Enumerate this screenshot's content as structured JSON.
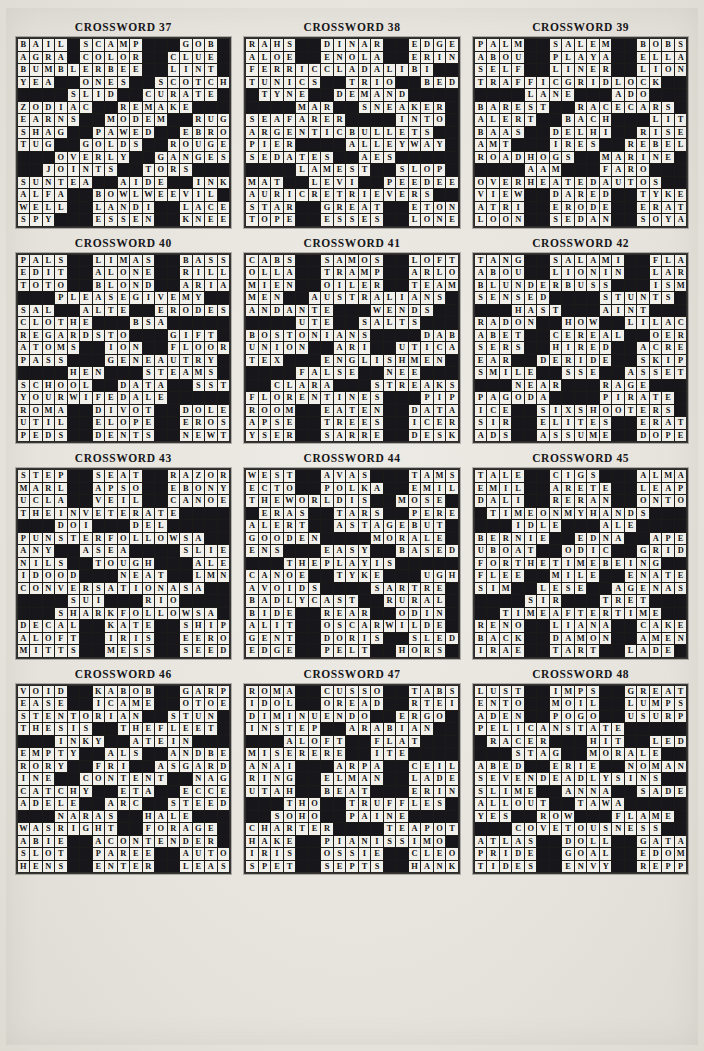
{
  "page": {
    "kind": "crossword-solutions-page",
    "grid_size": 17,
    "columns": 3,
    "rows": 4,
    "block_char": "#",
    "colors": {
      "paper": "#e8e6e0",
      "cell_fill": "#f2f0ea",
      "block_fill": "#17161a",
      "text": "#111014"
    }
  },
  "puzzles": [
    {
      "title": "CROSSWORD 37",
      "rows": [
        "BAIL#SCAMP###GOB#",
        "AGRA#COLOR##CLUE#",
        "BUMBLERBEE##LINT#",
        "YEA##ONES##SCOTCH",
        "####SLID##CURATE#",
        "ZODIAC##REMAKE###",
        "EARNS##MODEM##RUG",
        "SHAG##PAWED##EBRO",
        "TUG##GOLDS##ROUGE",
        "###OVERLY##GANGES",
        "##JOINTS##TORS###",
        "SUNTEA##AIDE##INK",
        "ALFA##BOWLWEEVIL#",
        "WELL##LANDI##LACE",
        "SPY###ESSEN##KNEE"
      ]
    },
    {
      "title": "CROSSWORD 38",
      "rows": [
        "RAHS##DINAR##EDGE#",
        "ALOE##ENOLA##ERIN#",
        "FERRICCLADALIBI##",
        "TUNICS##TRIO##BED#",
        "#TYNE##DEMAND####",
        "####MAR##SNEAKER#",
        "SEAFARER####INTO#",
        "ARGENTICBULLETS##",
        "PIER####ALLEYWAY#",
        "SEDATES##AES#####",
        "####LAMEST##SLOP#",
        "MAT##LEVI##PEEDEE",
        "AURICRETRIEVERS##",
        "STAR##GREAT##ETON",
        "TOPE##ESSES##LONE"
      ]
    },
    {
      "title": "CROSSWORD 39",
      "rows": [
        "PALM##SALEM##BOBS#",
        "ABOU##PLAYA##ELLA#",
        "SELF##LINER##LION#",
        "TRAFFICGRIDLOCK##",
        "####LANE###ADO###",
        "BAREST##RACECARS#",
        "ALERT##BACH###LIT",
        "BAAS##DELHI##RISE",
        "AMT###IRES##REBEL",
        "ROADHOGS##MARINE#",
        "####AAM###FARO###",
        "OVERHEATEDAUTOS##",
        "VIEW##DARED##TYKE",
        "ATRI##ERODE##ERAT",
        "LOON##SEDAN##SOYA"
      ]
    },
    {
      "title": "CROSSWORD 40",
      "rows": [
        "PALS##LIMAS##BASS#",
        "EDIT##ALONE##RILL#",
        "TOTO##BLOND##ARIA#",
        "###PLEASEGIVEMY##",
        "SAL##ALTE##ERODES",
        "CLOTHE###BSA#####",
        "REGARDSTO###GIFT#",
        "ATOMS##ION##FLOOR",
        "PASS###GENEAUTRY#",
        "####HEN###STEAMS#",
        "SCHOOL##DATA##SST",
        "YOURWIFEDALE#####",
        "ROMA##DIVOT##DOLE",
        "UTIL##ELOPE##EROS",
        "PEDS##DENTS##NEWT"
      ]
    },
    {
      "title": "CROSSWORD 41",
      "rows": [
        "CABS##SAMOS##LOFT#",
        "OLLA##TRAMP##ARLO#",
        "MIEN##OILER##TEAM#",
        "MEN##AUSTRALIANS#",
        "ANDANTE###WENDS##",
        "####UTE##SALTS###",
        "BOSTONIANS####DAB",
        "UNION##ARI##UTICA",
        "TEX###ENGLISHMEN#",
        "####FALSE##NEE###",
        "##CLARA###STREAKS",
        "FLORENTINES###PIP",
        "ROOM##EATEN##DATA",
        "APSE##TREES##ICER",
        "YSER##SARRE##DESK"
      ]
    },
    {
      "title": "CROSSWORD 42",
      "rows": [
        "TANG##SALAMI##FLA#",
        "ABOU##LIONIN##LAR#",
        "BLUNDERBUSS###ISM",
        "SENSED####STUNTS#",
        "###HAST###AINT###",
        "RADON##HOW##LILAC",
        "ABET##CEREAL##OER",
        "SERS##HIRED##ACRE",
        "EAR##DERIDE##SKIP",
        "SMILE##SSE##ASSET",
        "###NEAR###RAGE###",
        "PAGODA####PIRATE#",
        "ICE##SIXSHOOTERS#",
        "SIR##ELITES##ERAT",
        "ADS##ASSUME##DOPE"
      ]
    },
    {
      "title": "CROSSWORD 43",
      "rows": [
        "STEP##SEAT##RAZOR#",
        "MARL##APSO##EBONY#",
        "UCLA##VEIL##CANOE#",
        "THEINVETERATE####",
        "###DOI###DEL#####",
        "PUNSTERFOLLOWSA##",
        "ANY##ASEA####SLIER",
        "NILS##TOUGH###ALEE",
        "IDOOD###NEAT##LMN",
        "CONVERSATIONASA##",
        "####SUI###RIO####",
        "###SHARKFOLLOWSA#",
        "DECAL##KATE##SHIP",
        "ALOFT##IRIS##EERO",
        "MITTS##MESS##SEED"
      ]
    },
    {
      "title": "CROSSWORD 44",
      "rows": [
        "WEST##AVAS###TAMS#",
        "ECTO##POLKA##EMIL#",
        "THEWORLDIS##MOSE#",
        "#ERAS##TARS##PERE#",
        "ALERT##ASTAGEBUT#",
        "GOODEN####MORALE#",
        "ENS###EASY##BASED",
        "###THEPLAYIS#####",
        "CANOE##TYKE###UGH",
        "AVOIDS####SARTRE#",
        "BADLYCAST##RURAL#",
        "BIDE##REAR##ODIN#",
        "ALIT##OSCARWILDE#",
        "GENT##DORIS##SLED",
        "EDGE##PELT##HORS#"
      ]
    },
    {
      "title": "CROSSWORD 45",
      "rows": [
        "TALE##CIGS###ALMA#",
        "EMIL##ARETE##LEAP#",
        "DALI##RERAN##ONTO#",
        "#TIMEONMYHANDS###",
        "###IDLE###ALE####",
        "BERNIE##EDNA##APE#",
        "UBOAT##ODIC##GRID",
        "FORTHETIMEBEING##",
        "FLEE##MILE##ENATE",
        "SIM##LESE##AGENAS",
        "####SIR###TRET###",
        "##TIMEAFTERTIME##",
        "RENO##LIANA##CAKE",
        "BACK##DAMON##AMEN",
        "IRAE##TART##LADE#"
      ]
    },
    {
      "title": "CROSSWORD 46",
      "rows": [
        "VOID##KABOB##GARP#",
        "EASE##ICAME##OTOE#",
        "STENTORIAN##STUN#",
        "THESIS##THEFLEET#",
        "###INKY##ATEIN###",
        "EMPTY##ALS##ANDBE",
        "RORY##FRI##ASGARD",
        "INE##CONTENT##NAG",
        "CATCHY##ETA##ECCE",
        "ADELE##ARC##STEED",
        "###NARAS##HALE###",
        "WASRIGHT##FORAGE#",
        "ABIE##ACONTENDER#",
        "SLOT##PAREE##AUTO",
        "HENS##ENTER##LEAS"
      ]
    },
    {
      "title": "CROSSWORD 47",
      "rows": [
        "ROMA##CUSSO##TABS#",
        "IDOL##OREAD##RTEI#",
        "DIMINUENDO##ERGO#",
        "INSTEP##ARABIAN##",
        "###ALOFT##FLAT###",
        "MISERERE##ITE####",
        "ANAI###ARPA##CEIL",
        "RING##ELMAN##LADE",
        "UTAH##BEAT###ERIN",
        "###THO##TRUFFLES#",
        "##SOHO##PAINE####",
        "CHARTER####TEAPOT",
        "HAKE##PIANISSIMO#",
        "IRIS##OSSIE##CLEO",
        "SPET##SEPTS##HANK"
      ]
    },
    {
      "title": "CROSSWORD 48",
      "rows": [
        "LUST##IMPS##GREAT#",
        "ENTO##MOIL##LUMPS#",
        "ADEN##POGO##USURP#",
        "PELICANSTATE#####",
        "#RACER###HIT##LED#",
        "###STAG##MORALE##",
        "ABED##ERIE##NOMAN",
        "SEVENDEADLYSINS##",
        "SLIME##ANNA##SADE",
        "ALLOUT##TAWA#####",
        "YES##ROW###FLAME#",
        "###COVETOUSNESS##",
        "ATLAS##DOLL##GATA",
        "PRIDE##GOAL##EDOM",
        "TIDES##ENVY##REPP"
      ]
    }
  ]
}
